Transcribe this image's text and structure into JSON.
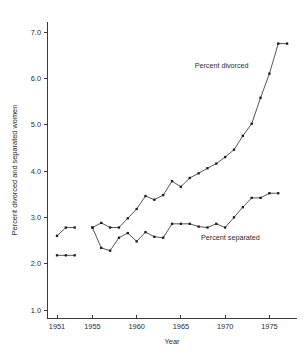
{
  "chart_data": {
    "type": "line",
    "title": "",
    "xlabel": "Year",
    "ylabel": "Percent divorced and separated women",
    "xlim": [
      1950.3,
      1977.6
    ],
    "ylim": [
      1.0,
      7.4
    ],
    "grid": false,
    "legend_position": "inline-annotations",
    "xticks": [
      1951,
      1955,
      1960,
      1965,
      1970,
      1975
    ],
    "xtick_labels": [
      "1951",
      "1955",
      "1960",
      "1965",
      "1970",
      "1975"
    ],
    "yticks": [
      1.0,
      2.0,
      3.0,
      4.0,
      5.0,
      6.0,
      7.0
    ],
    "ytick_labels": [
      "1.0",
      "2.0",
      "3.0",
      "4.0",
      "5.0",
      "6.0",
      "7.0"
    ],
    "annotations": [
      {
        "text": "Percent divorced",
        "x": 1969.6,
        "y": 6.22
      },
      {
        "text": "Percent separated",
        "x": 1970.6,
        "y": 2.52
      }
    ],
    "series": [
      {
        "name": "Percent divorced",
        "marker": "square",
        "segments": [
          {
            "x": [
              1951,
              1952,
              1953
            ],
            "y": [
              2.6,
              2.78,
              2.78
            ]
          },
          {
            "x": [
              1955,
              1956,
              1957,
              1958,
              1959,
              1960,
              1961,
              1962,
              1963,
              1964,
              1965,
              1966,
              1967,
              1968,
              1969,
              1970,
              1971,
              1972,
              1973,
              1974,
              1975,
              1976,
              1977
            ],
            "y": [
              2.78,
              2.88,
              2.78,
              2.78,
              2.98,
              3.18,
              3.46,
              3.38,
              3.48,
              3.78,
              3.66,
              3.85,
              3.95,
              4.06,
              4.16,
              4.3,
              4.46,
              4.76,
              5.02,
              5.58,
              6.1,
              6.75,
              6.75
            ]
          }
        ]
      },
      {
        "name": "Percent separated",
        "marker": "square",
        "segments": [
          {
            "x": [
              1951,
              1952,
              1953
            ],
            "y": [
              2.18,
              2.18,
              2.18
            ]
          },
          {
            "x": [
              1955,
              1956,
              1957,
              1958,
              1959,
              1960,
              1961,
              1962,
              1963,
              1964,
              1965,
              1966,
              1967,
              1968,
              1969,
              1970,
              1971,
              1972,
              1973,
              1974,
              1975,
              1976
            ],
            "y": [
              2.78,
              2.34,
              2.28,
              2.56,
              2.66,
              2.48,
              2.68,
              2.58,
              2.56,
              2.86,
              2.86,
              2.86,
              2.8,
              2.78,
              2.86,
              2.78,
              3.0,
              3.22,
              3.42,
              3.42,
              3.52,
              3.52
            ]
          }
        ]
      }
    ]
  },
  "colors": {
    "line": "#2a2a2a",
    "marker": "#1a1a1a",
    "axis": "#3a3a3a",
    "text": "#2b2b2b",
    "background": "#ffffff"
  }
}
